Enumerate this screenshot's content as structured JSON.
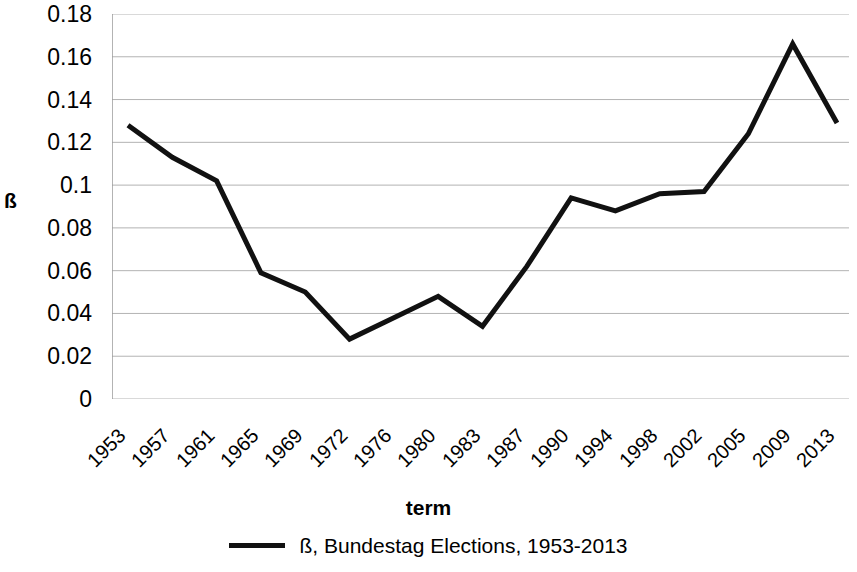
{
  "chart_data": {
    "type": "line",
    "title": "",
    "xlabel": "term",
    "ylabel": "ß",
    "categories": [
      "1953",
      "1957",
      "1961",
      "1965",
      "1969",
      "1972",
      "1976",
      "1980",
      "1983",
      "1987",
      "1990",
      "1994",
      "1998",
      "2002",
      "2005",
      "2009",
      "2013"
    ],
    "series": [
      {
        "name": "ß, Bundestag Elections, 1953-2013",
        "color": "#111111",
        "values": [
          0.128,
          0.113,
          0.102,
          0.059,
          0.05,
          0.028,
          0.038,
          0.048,
          0.034,
          0.062,
          0.094,
          0.088,
          0.096,
          0.097,
          0.124,
          0.166,
          0.129
        ]
      }
    ],
    "ylim": [
      0,
      0.18
    ],
    "y_ticks": [
      "0.18",
      "0.16",
      "0.14",
      "0.12",
      "0.1",
      "0.08",
      "0.06",
      "0.04",
      "0.02",
      "0"
    ],
    "y_tick_values": [
      0.18,
      0.16,
      0.14,
      0.12,
      0.1,
      0.08,
      0.06,
      0.04,
      0.02,
      0
    ],
    "grid": true,
    "grid_color": "#b3b3b3",
    "axis_color": "#9a9a9a",
    "legend_position": "bottom"
  },
  "legend": {
    "entries": [
      {
        "label": "ß, Bundestag Elections, 1953-2013",
        "marker": "line-swatch"
      }
    ]
  },
  "axes": {
    "x_title": "term",
    "y_title": "ß"
  }
}
